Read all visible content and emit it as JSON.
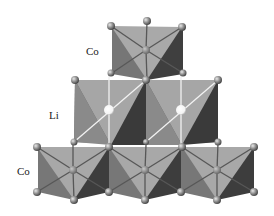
{
  "diagram": {
    "type": "crystal-structure",
    "labels": [
      {
        "id": "co-top",
        "text": "Co",
        "x": 86,
        "y": 46
      },
      {
        "id": "li-middle",
        "text": "Li",
        "x": 48,
        "y": 110
      },
      {
        "id": "co-bottom",
        "text": "Co",
        "x": 17,
        "y": 165
      }
    ],
    "layers": [
      {
        "name": "Co",
        "octahedra": 1,
        "center_atom_color": "#8a8a8a"
      },
      {
        "name": "Li",
        "octahedra": 2,
        "center_atom_color": "#ffffff"
      },
      {
        "name": "Co",
        "octahedra": 3,
        "center_atom_color": "#8a8a8a"
      }
    ],
    "colors": {
      "face_light": "#a8a8a8",
      "face_mid": "#8c8c8c",
      "face_dark": "#3f3f3f",
      "face_side": "#6e6e6e",
      "oxygen_atom": "#9a9a9a",
      "li_atom": "#ffffff",
      "bond": "#555555",
      "li_bond": "#f0f0f0"
    }
  }
}
